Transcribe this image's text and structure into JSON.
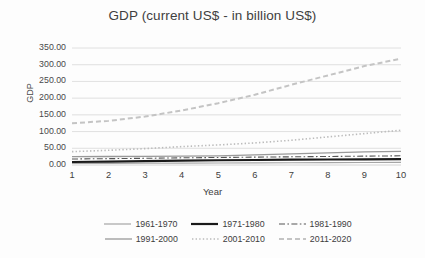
{
  "chart_data": {
    "type": "line",
    "title": "GDP (current US$ - in billion US$)",
    "xlabel": "Year",
    "ylabel": "GDP",
    "x": [
      1,
      2,
      3,
      4,
      5,
      6,
      7,
      8,
      9,
      10
    ],
    "xticklabels": [
      "1",
      "2",
      "3",
      "4",
      "5",
      "6",
      "7",
      "8",
      "9",
      "10"
    ],
    "yticklabels": [
      "350.00",
      "300.00",
      "250.00",
      "200.00",
      "150.00",
      "100.00",
      "50.00",
      "0.00"
    ],
    "ytickvalues": [
      350,
      300,
      250,
      200,
      150,
      100,
      50,
      0
    ],
    "ylim": [
      0,
      350
    ],
    "xlim": [
      1,
      10
    ],
    "grid": "horizontal",
    "legend_position": "bottom",
    "series": [
      {
        "name": "1961-1970",
        "style": "solid",
        "color": "#a6a6a6",
        "width": 1.1,
        "values": [
          4.5,
          4.8,
          5.2,
          5.6,
          6.0,
          6.4,
          6.8,
          7.1,
          7.5,
          7.9
        ]
      },
      {
        "name": "1971-1980",
        "style": "solid",
        "color": "#1a1a1a",
        "width": 2.2,
        "values": [
          9.0,
          10.2,
          11.5,
          13.0,
          14.2,
          15.0,
          15.8,
          16.4,
          17.0,
          17.6
        ]
      },
      {
        "name": "1981-1990",
        "style": "dashdot",
        "color": "#555555",
        "width": 1.1,
        "values": [
          18.0,
          19.0,
          20.0,
          21.5,
          22.5,
          23.5,
          24.5,
          25.5,
          26.5,
          27.5
        ]
      },
      {
        "name": "1991-2000",
        "style": "solid",
        "color": "#999999",
        "width": 1.3,
        "values": [
          25.0,
          25.5,
          26.0,
          26.5,
          27.5,
          30.0,
          33.5,
          36.5,
          39.0,
          41.0
        ]
      },
      {
        "name": "2001-2010",
        "style": "dotted",
        "color": "#bbbbbb",
        "width": 1.6,
        "values": [
          40.0,
          44.0,
          49.0,
          55.0,
          60.0,
          66.0,
          74.0,
          84.0,
          94.0,
          104.0
        ]
      },
      {
        "name": "2011-2020",
        "style": "dashed",
        "color": "#c4c4c4",
        "width": 2.0,
        "values": [
          125.0,
          132.0,
          145.0,
          163.0,
          185.0,
          210.0,
          240.0,
          268.0,
          296.0,
          318.0
        ]
      }
    ]
  }
}
